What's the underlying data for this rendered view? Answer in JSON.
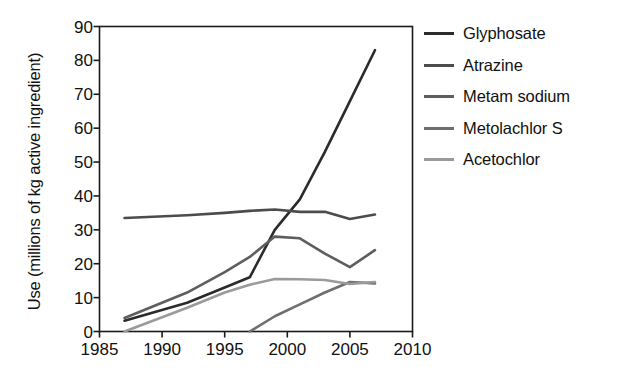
{
  "chart_data": {
    "type": "line",
    "title": "",
    "xlabel": "",
    "ylabel": "Use (millions of kg active ingredient)",
    "xlim": [
      1985,
      2010
    ],
    "ylim": [
      0,
      90
    ],
    "grid": false,
    "legend_position": "right",
    "xticks": [
      "1985",
      "1990",
      "1995",
      "2000",
      "2005",
      "2010"
    ],
    "yticks": [
      "0",
      "10",
      "20",
      "30",
      "40",
      "50",
      "60",
      "70",
      "80",
      "90"
    ],
    "series": [
      {
        "name": "Glyphosate",
        "color": "#2b2b2b",
        "x": [
          1987,
          1992,
          1995,
          1997,
          1999,
          2001,
          2003,
          2005,
          2007
        ],
        "values": [
          3.2,
          8.5,
          13.0,
          16.0,
          30.0,
          39.0,
          53.0,
          68.0,
          83.0
        ]
      },
      {
        "name": "Atrazine",
        "color": "#4c4c4c",
        "x": [
          1987,
          1992,
          1995,
          1997,
          1999,
          2001,
          2003,
          2005,
          2007
        ],
        "values": [
          33.5,
          34.3,
          35.0,
          35.6,
          36.0,
          35.3,
          35.3,
          33.2,
          34.5
        ]
      },
      {
        "name": "Metam sodium",
        "color": "#5e5e5e",
        "x": [
          1987,
          1992,
          1995,
          1997,
          1999,
          2001,
          2003,
          2005,
          2007
        ],
        "values": [
          4.0,
          11.5,
          17.5,
          22.0,
          28.0,
          27.5,
          23.0,
          19.0,
          24.0
        ]
      },
      {
        "name": "Metolachlor S",
        "color": "#6e6e6e",
        "x": [
          1997,
          1999,
          2001,
          2003,
          2005,
          2007
        ],
        "values": [
          0.0,
          4.5,
          8.0,
          11.5,
          14.6,
          14.2
        ]
      },
      {
        "name": "Acetochlor",
        "color": "#9a9a9a",
        "x": [
          1987,
          1992,
          1995,
          1997,
          1999,
          2001,
          2003,
          2005,
          2007
        ],
        "values": [
          0.0,
          7.0,
          11.5,
          13.8,
          15.5,
          15.4,
          15.2,
          14.0,
          14.6
        ]
      }
    ]
  },
  "legend": {
    "items": [
      {
        "label": "Glyphosate"
      },
      {
        "label": "Atrazine"
      },
      {
        "label": "Metam sodium"
      },
      {
        "label": "Metolachlor S"
      },
      {
        "label": "Acetochlor"
      }
    ]
  }
}
